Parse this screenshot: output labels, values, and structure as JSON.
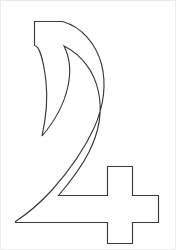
{
  "document": {
    "title": "Outline drawing of numeral four with cross",
    "subject": "numeral-four-glyph",
    "caption": ""
  },
  "canvas": {
    "width": 176,
    "height": 250,
    "background_color": "#ffffff",
    "border_color": "#ececec"
  },
  "artwork": {
    "name": "four-with-cross-outline",
    "description": "Line-art outline of a stylized numeral 4 formed by a curved descending stroke and a plus-shaped cross at lower right",
    "style": "outline",
    "stroke_color": "#3a3a3a",
    "fill_color": "#ffffff",
    "stroke_width": 1.15,
    "parts": [
      {
        "name": "curved-descender",
        "label": "Curved descending stroke"
      },
      {
        "name": "baseline-bar",
        "label": "Horizontal baseline bar"
      },
      {
        "name": "cross-shape",
        "label": "Plus shaped cross"
      }
    ],
    "path": "M 34.5 21.5 L 62.5 21.5 C 82 27 96 44 101.5 64 C 107 86 103 108 94 128 C 84 150 68 172 52 190 C 42 201 30 212 15.5 221.5 L 15.5 222.5 L 107.5 222.5 L 107.5 243.5 L 132.5 243.5 L 132.5 222.5 L 158.5 222.5 L 158.5 195.5 L 132.5 195.5 L 132.5 166.5 L 107.5 166.5 L 107.5 195.5 L 58.5 195.5 C 70 182 81 168 89 152 C 98 134 103 113 98.5 92 C 94.5 72 82 55 64 46 C 70 58 71 72 68 86 C 64 105 54 122 42 136 C 46 118 48 100 46 82 C 44 64 40 46 34.5 45.5 Z"
  },
  "layers": [
    {
      "name": "background-layer",
      "label": "White background"
    },
    {
      "name": "glyph-layer",
      "label": "Glyph outline"
    },
    {
      "name": "border-layer",
      "label": "Image edge border"
    }
  ]
}
